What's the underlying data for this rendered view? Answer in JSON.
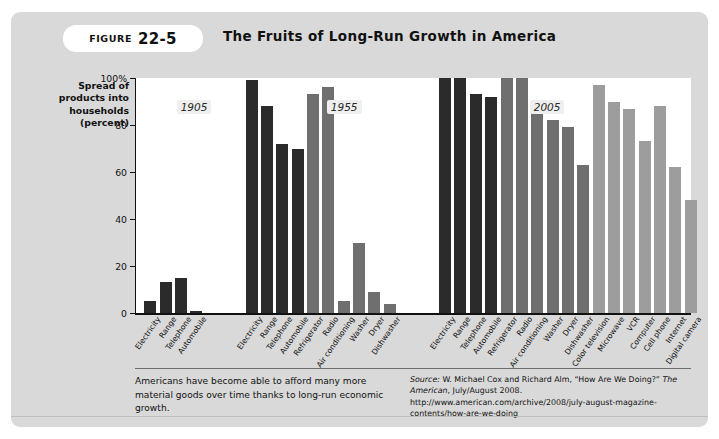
{
  "figure": {
    "badge_word": "FIGURE",
    "badge_number": "22-5",
    "title": "The Fruits of Long-Run Growth in America"
  },
  "axis": {
    "y_title": "Spread of products into households (percent)",
    "y_ticks": [
      "100%",
      "80",
      "60",
      "40",
      "20",
      "0"
    ],
    "y_tick_values": [
      100,
      80,
      60,
      40,
      20,
      0
    ]
  },
  "group_labels": [
    {
      "label": "1905",
      "left_pct": 7.5
    },
    {
      "label": "1955",
      "left_pct": 34.5
    },
    {
      "label": "2005",
      "left_pct": 71.0
    }
  ],
  "colors": {
    "panel_background": "#d9d9d9",
    "plot_background": "#ffffff",
    "bar_dark": "#2b2b2b",
    "bar_medium": "#6f6f6f",
    "bar_light": "#9d9d9d",
    "axis": "#111111",
    "badge_background": "#ffffff",
    "year_tag_background": "#efefef"
  },
  "caption": "Americans have become able to afford many more material goods over time thanks to long-run economic growth.",
  "source": {
    "prefix": "Source:",
    "text_1": " W. Michael Cox and Richard Alm, “How Are We Doing?” ",
    "italic_1": "The American",
    "text_2": ", July/August 2008.",
    "url": "http://www.american.com/archive/2008/july-august-magazine-contents/how-are-we-doing"
  },
  "chart_data": {
    "type": "bar",
    "title": "The Fruits of Long-Run Growth in America",
    "xlabel": "",
    "ylabel": "Spread of products into households (percent)",
    "ylim": [
      0,
      100
    ],
    "grid": false,
    "legend": "none",
    "groups": [
      {
        "year": "1905",
        "categories": [
          "Electricity",
          "Range",
          "Telephone",
          "Automobile"
        ],
        "values": [
          5,
          13,
          15,
          1
        ],
        "shades": [
          "dark",
          "dark",
          "dark",
          "dark"
        ]
      },
      {
        "year": "1955",
        "categories": [
          "Electricity",
          "Range",
          "Telephone",
          "Automobile",
          "Refrigerator",
          "Radio",
          "Air conditioning",
          "Washer",
          "Dryer",
          "Dishwasher"
        ],
        "values": [
          99,
          88,
          72,
          70,
          93,
          96,
          5,
          30,
          9,
          4
        ],
        "shades": [
          "dark",
          "dark",
          "dark",
          "dark",
          "medium",
          "medium",
          "medium",
          "medium",
          "medium",
          "medium"
        ]
      },
      {
        "year": "2005",
        "categories": [
          "Electricity",
          "Range",
          "Telephone",
          "Automobile",
          "Refrigerator",
          "Radio",
          "Air conditioning",
          "Washer",
          "Dryer",
          "Dishwasher",
          "Color television",
          "Microwave",
          "VCR",
          "Computer",
          "Cell phone",
          "Internet",
          "Digital camera"
        ],
        "values": [
          100,
          100,
          93,
          92,
          100,
          100,
          89,
          82,
          79,
          63,
          97,
          90,
          87,
          73,
          88,
          62,
          48
        ],
        "shades": [
          "dark",
          "dark",
          "dark",
          "dark",
          "medium",
          "medium",
          "medium",
          "medium",
          "medium",
          "medium",
          "light",
          "light",
          "light",
          "light",
          "light",
          "light",
          "light"
        ]
      }
    ]
  }
}
